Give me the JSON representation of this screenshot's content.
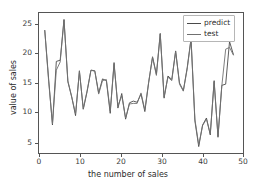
{
  "figure": {
    "background_color": "#ffffff",
    "axes_color": "#555555",
    "text_color": "#2b2b2b"
  },
  "axis": {
    "xlabel": "the number of sales",
    "ylabel": "value of sales",
    "xticks": [
      "0",
      "10",
      "20",
      "30",
      "40",
      "50"
    ],
    "yticks": [
      "5",
      "10",
      "15",
      "20",
      "25"
    ]
  },
  "legend": {
    "position": "upper-right",
    "entries": [
      {
        "label": "predict",
        "color": "#4a4a4a"
      },
      {
        "label": "test",
        "color": "#707070"
      }
    ]
  },
  "chart_data": {
    "type": "line",
    "title": "",
    "xlabel": "the number of sales",
    "ylabel": "value of sales",
    "xlim": [
      -1.5,
      51.5
    ],
    "ylim": [
      2.8,
      26.8
    ],
    "xticks": [
      0,
      10,
      20,
      30,
      40,
      50
    ],
    "yticks": [
      5,
      10,
      15,
      20,
      25
    ],
    "grid": false,
    "legend_position": "upper right",
    "x": [
      0,
      1,
      2,
      3,
      4,
      5,
      6,
      7,
      8,
      9,
      10,
      11,
      12,
      13,
      14,
      15,
      16,
      17,
      18,
      19,
      20,
      21,
      22,
      23,
      24,
      25,
      26,
      27,
      28,
      29,
      30,
      31,
      32,
      33,
      34,
      35,
      36,
      37,
      38,
      39,
      40,
      41,
      42,
      43,
      44,
      45,
      46,
      47,
      48,
      49
    ],
    "series": [
      {
        "name": "predict",
        "color": "#4a4a4a",
        "values": [
          23.8,
          15.5,
          7.6,
          18.5,
          18.7,
          25.7,
          15.0,
          12.4,
          9.2,
          16.9,
          10.3,
          13.3,
          17.0,
          16.9,
          13.1,
          15.5,
          15.2,
          9.6,
          18.3,
          10.5,
          13.0,
          8.6,
          11.4,
          11.7,
          11.5,
          12.9,
          9.9,
          14.9,
          19.3,
          16.3,
          23.3,
          12.2,
          16.0,
          15.4,
          20.3,
          14.8,
          13.5,
          17.4,
          22.4,
          8.3,
          3.9,
          7.6,
          8.8,
          5.9,
          15.2,
          5.5,
          14.4,
          14.6,
          21.9,
          19.7
        ]
      },
      {
        "name": "test",
        "color": "#707070",
        "values": [
          23.8,
          15.1,
          7.8,
          17.0,
          18.4,
          25.6,
          15.2,
          12.4,
          9.5,
          16.8,
          10.4,
          13.5,
          17.0,
          16.8,
          12.9,
          15.2,
          15.4,
          10.0,
          18.0,
          10.9,
          12.6,
          8.8,
          11.2,
          11.3,
          11.3,
          13.1,
          10.2,
          15.0,
          19.2,
          16.1,
          23.2,
          12.4,
          15.8,
          15.2,
          20.2,
          14.6,
          13.4,
          17.2,
          22.3,
          8.6,
          4.2,
          7.5,
          8.6,
          6.1,
          15.0,
          5.7,
          14.3,
          20.6,
          20.9,
          19.6
        ]
      }
    ]
  }
}
